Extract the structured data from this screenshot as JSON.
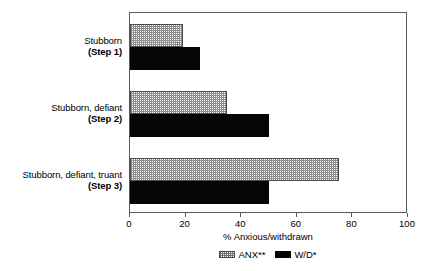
{
  "chart_data": {
    "type": "bar",
    "orientation": "horizontal",
    "title": "",
    "subtitle": "",
    "xlabel": "% Anxious/withdrawn",
    "ylabel": "",
    "xlim": [
      0,
      100
    ],
    "xticks": [
      0,
      20,
      40,
      60,
      80,
      100
    ],
    "xtick_labels": [
      "0",
      "20",
      "40",
      "60",
      "80",
      "100"
    ],
    "grid": false,
    "legend_position": "bottom-center",
    "categories": [
      "Stubborn (Step 1)",
      "Stubborn, defiant (Step 2)",
      "Stubborn, defiant, truant (Step 3)"
    ],
    "category_lines": [
      {
        "name": "Stubborn",
        "step": "(Step 1)"
      },
      {
        "name": "Stubborn, defiant",
        "step": "(Step 2)"
      },
      {
        "name": "Stubborn, defiant, truant",
        "step": "(Step 3)"
      }
    ],
    "series": [
      {
        "name": "ANX**",
        "fill": "hatched",
        "color": "#8d8d8d",
        "values": [
          19,
          35,
          75
        ]
      },
      {
        "name": "W/D*",
        "fill": "solid",
        "color": "#050505",
        "values": [
          25,
          50,
          50
        ]
      }
    ]
  },
  "legend": {
    "entries": [
      {
        "label": "ANX**",
        "swatch": "hatched-swatch"
      },
      {
        "label": "W/D*",
        "swatch": "solid-black-swatch"
      }
    ]
  },
  "axis": {
    "x_label": "% Anxious/withdrawn",
    "tick_labels": [
      "0",
      "20",
      "40",
      "60",
      "80",
      "100"
    ]
  }
}
